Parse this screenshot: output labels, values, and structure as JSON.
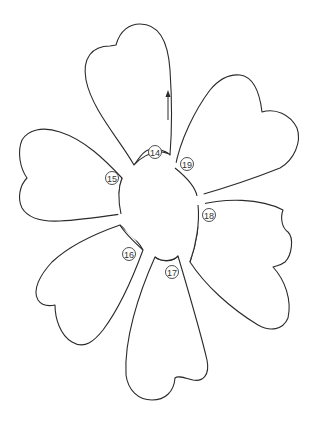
{
  "diagram": {
    "type": "flower-petal-template",
    "stroke_color": "#2a2a2a",
    "background": "#ffffff",
    "petals": [
      {
        "id": "top",
        "label": "14"
      },
      {
        "id": "upper-right",
        "label": "19"
      },
      {
        "id": "right",
        "label": "18"
      },
      {
        "id": "bottom",
        "label": "17"
      },
      {
        "id": "lower-left",
        "label": "16"
      },
      {
        "id": "left",
        "label": "15"
      }
    ],
    "arrow": {
      "direction": "up"
    }
  }
}
